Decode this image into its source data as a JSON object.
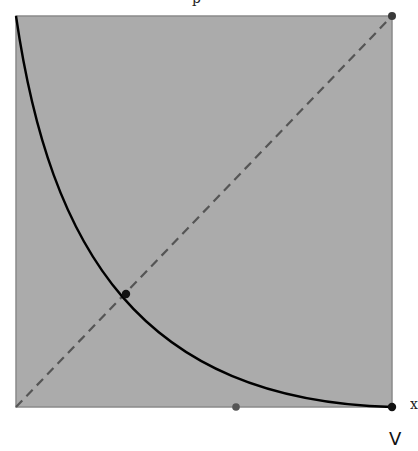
{
  "diagram": {
    "top_label": "p",
    "right_label": "x",
    "bottom_label": "V",
    "colors": {
      "region_fill": "#ababab",
      "region_border": "#8a8a8a",
      "curve": "#000000",
      "diagonal": "#555555",
      "point_black": "#111111",
      "point_gray": "#555555",
      "background": "#ffffff"
    },
    "region": {
      "x0": 16,
      "y0": 16,
      "x1": 392,
      "y1": 407
    },
    "curve": {
      "type": "decreasing convex curve",
      "from": [
        16,
        16
      ],
      "to": [
        392,
        407
      ],
      "through": [
        126,
        294
      ]
    },
    "diagonal": {
      "style": "dashed",
      "from": [
        16,
        407
      ],
      "to": [
        392,
        16
      ]
    },
    "points": [
      {
        "name": "top-right",
        "x": 392,
        "y": 16,
        "color": "gray"
      },
      {
        "name": "intersection",
        "x": 126,
        "y": 294,
        "color": "black"
      },
      {
        "name": "bottom-mid",
        "x": 236,
        "y": 407,
        "color": "gray"
      },
      {
        "name": "bottom-right",
        "x": 392,
        "y": 407,
        "color": "black"
      }
    ]
  }
}
